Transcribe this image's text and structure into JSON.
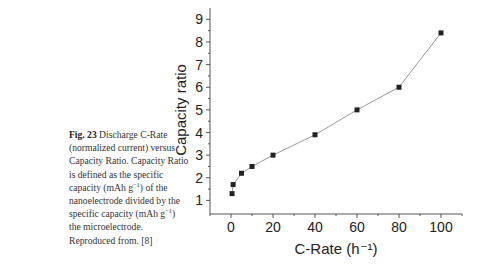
{
  "caption": {
    "figure_label": "Fig. 23",
    "text_1": " Discharge C-Rate (normalized current) versus Capacity Ratio. Capacity Ratio is defined as the specific capacity (mAh g",
    "sup_1": "−1",
    "text_2": ") of the nanoelectrode divided by the specific capacity (mAh g",
    "sup_2": "−1",
    "text_3": ") the microelectrode. Reproduced from. [8]"
  },
  "chart_data": {
    "type": "line",
    "title": "",
    "xlabel": "C-Rate (h⁻¹)",
    "ylabel": "Capacity ratio",
    "xlim": [
      -10,
      110
    ],
    "ylim": [
      0.4,
      9.5
    ],
    "x_ticks": [
      0,
      20,
      40,
      60,
      80,
      100
    ],
    "y_ticks": [
      1,
      2,
      3,
      4,
      5,
      6,
      7,
      8,
      9
    ],
    "grid": false,
    "legend": null,
    "marker": "square",
    "series": [
      {
        "name": "Capacity ratio",
        "x": [
          0.5,
          1,
          5,
          10,
          20,
          40,
          60,
          80,
          100
        ],
        "y": [
          1.3,
          1.7,
          2.2,
          2.5,
          3.0,
          3.9,
          5.0,
          6.0,
          8.4
        ]
      }
    ]
  }
}
